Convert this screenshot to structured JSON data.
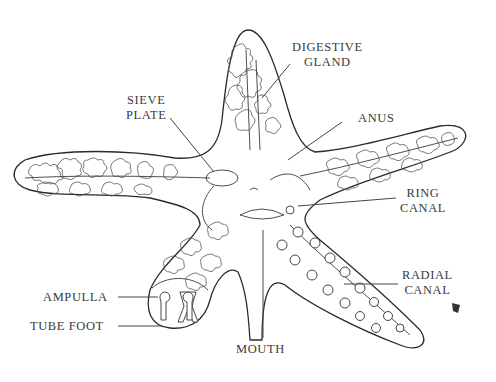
{
  "diagram": {
    "labels": {
      "digestive_gland": [
        "DIGESTIVE",
        "GLAND"
      ],
      "sieve_plate": [
        "SIEVE",
        "PLATE"
      ],
      "anus": "ANUS",
      "ring_canal": [
        "RING",
        "CANAL"
      ],
      "radial_canal": [
        "RADIAL",
        "CANAL"
      ],
      "ampulla": "AMPULLA",
      "tube_foot": "TUBE FOOT",
      "mouth": "MOUTH"
    },
    "colors": {
      "line": "#2a2a2a",
      "text": "#3a3a3a",
      "background": "#ffffff"
    }
  }
}
